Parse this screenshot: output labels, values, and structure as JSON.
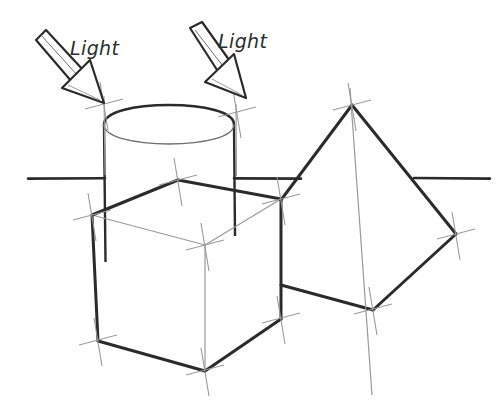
{
  "drawing": {
    "title": "Perspective construction sketch of cylinder, cube and pyramid with light direction arrows",
    "background_color": "#ffffff",
    "ink_color": "#2b2b2b",
    "construction_line_color": "#9a9a9a",
    "labels": [
      {
        "id": "light-label-left",
        "text": "Light",
        "x": 70,
        "y": 55
      },
      {
        "id": "light-label-right",
        "text": "Light",
        "x": 218,
        "y": 48
      }
    ],
    "arrows": [
      {
        "id": "light-arrow-left",
        "name": "light-direction-arrow-left",
        "direction": "down-right",
        "tail_x": 35,
        "tail_y": 35,
        "tip_x": 103,
        "tip_y": 103
      },
      {
        "id": "light-arrow-right",
        "name": "light-direction-arrow-right",
        "direction": "down-right",
        "tail_x": 190,
        "tail_y": 24,
        "tip_x": 245,
        "tip_y": 90
      }
    ],
    "horizon": {
      "name": "horizon-line",
      "y": 178,
      "segments": [
        {
          "x1": 28,
          "x2": 105
        },
        {
          "x1": 234,
          "x2": 300
        },
        {
          "x1": 415,
          "x2": 490
        }
      ]
    },
    "shapes": [
      {
        "id": "cylinder",
        "name": "cylinder",
        "top_center_x": 169,
        "top_center_y": 125,
        "radius_x": 65,
        "radius_y": 15,
        "left_x": 104,
        "right_x": 234,
        "base_y": 260
      },
      {
        "id": "cube",
        "name": "cube",
        "vertices": {
          "top_back": [
            178,
            180
          ],
          "top_left": [
            92,
            215
          ],
          "top_right": [
            281,
            199
          ],
          "top_front": [
            205,
            245
          ],
          "bottom_left": [
            98,
            340
          ],
          "bottom_front": [
            205,
            370
          ],
          "bottom_right": [
            281,
            318
          ]
        }
      },
      {
        "id": "pyramid",
        "name": "pyramid",
        "vertices": {
          "apex": [
            352,
            105
          ],
          "base_right": [
            456,
            234
          ],
          "base_front": [
            373,
            309
          ],
          "base_left": [
            281,
            200
          ],
          "base_back_hidden": [
            372,
            395
          ]
        }
      }
    ],
    "vertex_marks": [
      {
        "name": "vertex-mark-cylinder-left-top",
        "x": 104,
        "y": 103
      },
      {
        "name": "vertex-mark-cylinder-right-top",
        "x": 236,
        "y": 112
      },
      {
        "name": "vertex-mark-cube-top-back",
        "x": 178,
        "y": 180
      },
      {
        "name": "vertex-mark-cube-top-left",
        "x": 92,
        "y": 215
      },
      {
        "name": "vertex-mark-cube-top-right",
        "x": 281,
        "y": 199
      },
      {
        "name": "vertex-mark-cube-top-front",
        "x": 205,
        "y": 245
      },
      {
        "name": "vertex-mark-cube-bottom-left",
        "x": 98,
        "y": 340
      },
      {
        "name": "vertex-mark-cube-bottom-front",
        "x": 205,
        "y": 370
      },
      {
        "name": "vertex-mark-cube-bottom-right",
        "x": 281,
        "y": 318
      },
      {
        "name": "vertex-mark-pyramid-apex",
        "x": 352,
        "y": 105
      },
      {
        "name": "vertex-mark-pyramid-base-right",
        "x": 456,
        "y": 234
      },
      {
        "name": "vertex-mark-pyramid-base-front",
        "x": 373,
        "y": 309
      }
    ]
  }
}
